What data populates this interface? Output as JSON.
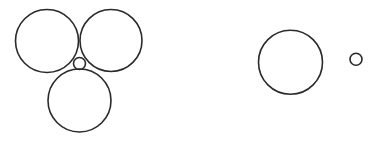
{
  "diagram": {
    "background": "#ffffff",
    "stroke_color": "#2a2a2a",
    "stroke_width": 1.6,
    "groups": [
      {
        "name": "cluster-left",
        "circles": [
          {
            "name": "circle-top-left",
            "cx": 47,
            "cy": 41,
            "r": 31.5
          },
          {
            "name": "circle-top-right",
            "cx": 111,
            "cy": 40.5,
            "r": 31
          },
          {
            "name": "circle-bottom",
            "cx": 79.5,
            "cy": 100.5,
            "r": 31.5
          },
          {
            "name": "circle-center-small",
            "cx": 79.5,
            "cy": 63.5,
            "r": 6
          }
        ]
      },
      {
        "name": "pair-right",
        "circles": [
          {
            "name": "circle-right-large",
            "cx": 290.5,
            "cy": 62.3,
            "r": 32
          },
          {
            "name": "circle-right-small",
            "cx": 356,
            "cy": 59.3,
            "r": 6
          }
        ]
      }
    ]
  }
}
